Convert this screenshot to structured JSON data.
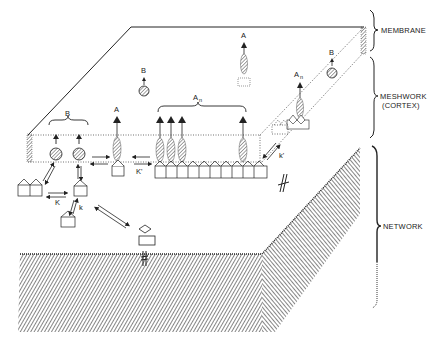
{
  "figure": {
    "layers": [
      {
        "id": "membrane",
        "label": "MEMBRANE"
      },
      {
        "id": "meshwork",
        "label": "MESHWORK",
        "sublabel": "(CORTEX)"
      },
      {
        "id": "network",
        "label": "NETWORK"
      }
    ],
    "symbols": {
      "B_group": "B",
      "B_free_membrane": "B",
      "B_right": "B",
      "A_single": "A",
      "A_membrane": "A",
      "An_group": "A",
      "An_group_sub": "n",
      "An_right": "A",
      "An_right_sub": "n",
      "K_upper": "K'",
      "K_lower": "K",
      "k_lower": "k",
      "k_right": "k'"
    },
    "colors": {
      "ink": "#222222",
      "hatch": "#333333",
      "background": "#ffffff"
    }
  }
}
